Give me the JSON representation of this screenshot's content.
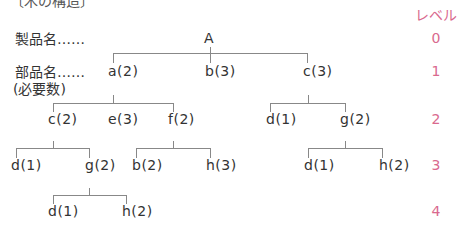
{
  "title_fragment": "〔木の構造〕",
  "level_header": "レベル",
  "row_labels": {
    "product": "製品名……",
    "part": "部品名……",
    "required_qty": "(必要数)"
  },
  "levels": [
    "0",
    "1",
    "2",
    "3",
    "4"
  ],
  "colors": {
    "text": "#333333",
    "lines": "#888888",
    "level_accent": "#d9698e"
  },
  "nodes": {
    "root": "A",
    "l1": [
      "a(2)",
      "b(3)",
      "c(3)"
    ],
    "l2_a": [
      "c(2)",
      "e(3)",
      "f(2)"
    ],
    "l2_c": [
      "d(1)",
      "g(2)"
    ],
    "l3_c": [
      "d(1)",
      "g(2)"
    ],
    "l3_f": [
      "b(2)",
      "h(3)"
    ],
    "l3_g": [
      "d(1)",
      "h(2)"
    ],
    "l4_g": [
      "d(1)",
      "h(2)"
    ]
  }
}
